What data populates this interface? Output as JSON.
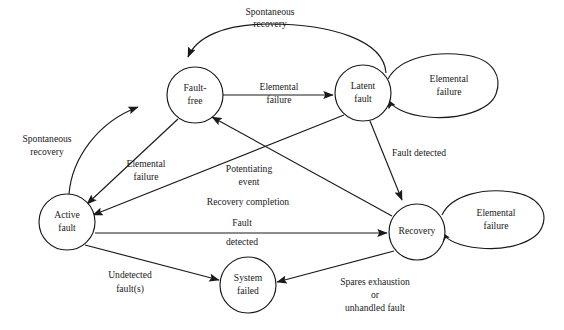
{
  "diagram": {
    "type": "state-diagram",
    "stroke_color": "#1a1a1a",
    "background_color": "#ffffff",
    "nodes": [
      {
        "id": "fault-free",
        "label_line1": "Fault-",
        "label_line2": "free",
        "cx": 195,
        "cy": 95,
        "r": 28
      },
      {
        "id": "latent-fault",
        "label_line1": "Latent",
        "label_line2": "fault",
        "cx": 363,
        "cy": 93,
        "r": 28
      },
      {
        "id": "active-fault",
        "label_line1": "Active",
        "label_line2": "fault",
        "cx": 67,
        "cy": 222,
        "r": 28
      },
      {
        "id": "recovery",
        "label_line1": "Recovery",
        "label_line2": "",
        "cx": 417,
        "cy": 232,
        "r": 28
      },
      {
        "id": "system-failed",
        "label_line1": "System",
        "label_line2": "failed",
        "cx": 248,
        "cy": 285,
        "r": 28
      }
    ],
    "self_loops": [
      {
        "id": "latent-fault-loop",
        "on": "latent-fault",
        "label_line1": "Elemental",
        "label_line2": "failure",
        "cx": 443,
        "cy": 87,
        "rx": 57,
        "ry": 27
      },
      {
        "id": "recovery-loop",
        "on": "recovery",
        "label_line1": "Elemental",
        "label_line2": "failure",
        "cx": 494,
        "cy": 220,
        "rx": 52,
        "ry": 25
      }
    ],
    "edges": [
      {
        "id": "latent-to-faultfree-spontaneous",
        "from": "latent-fault",
        "to": "fault-free",
        "label_line1": "Spontaneous",
        "label_line2": "recovery",
        "label_x": 270,
        "label_y": 13,
        "label_y2": 25
      },
      {
        "id": "faultfree-to-latent-elemental",
        "from": "fault-free",
        "to": "latent-fault",
        "label_line1": "Elemental",
        "label_line2": "failure",
        "label_x": 279,
        "label_y": 88,
        "label_y2": 101
      },
      {
        "id": "active-to-faultfree-spontaneous",
        "from": "active-fault",
        "to": "fault-free",
        "label_line1": "Spontaneous",
        "label_line2": "recovery",
        "label_x": 47,
        "label_y": 140,
        "label_y2": 153
      },
      {
        "id": "faultfree-to-active-elemental",
        "from": "fault-free",
        "to": "active-fault",
        "label_line1": "Elemental",
        "label_line2": "failure",
        "label_x": 146,
        "label_y": 165,
        "label_y2": 178
      },
      {
        "id": "latent-to-active-potentiating",
        "from": "latent-fault",
        "to": "active-fault",
        "label_line1": "Potentiating",
        "label_line2": "event",
        "label_x": 249,
        "label_y": 170,
        "label_y2": 183
      },
      {
        "id": "recovery-to-faultfree-completion",
        "from": "recovery",
        "to": "fault-free",
        "label_line1": "Recovery completion",
        "label_line2": "",
        "label_x": 248,
        "label_y": 203,
        "label_y2": 0
      },
      {
        "id": "latent-to-recovery-detected",
        "from": "latent-fault",
        "to": "recovery",
        "label_line1": "Fault detected",
        "label_line2": "",
        "label_x": 419,
        "label_y": 154,
        "label_y2": 0
      },
      {
        "id": "active-to-recovery-detected",
        "from": "active-fault",
        "to": "recovery",
        "label_line1": "Fault",
        "label_line2": "detected",
        "label_x": 242,
        "label_y": 224,
        "label_y2": 243
      },
      {
        "id": "active-to-systemfailed-undetected",
        "from": "active-fault",
        "to": "system-failed",
        "label_line1": "Undetected",
        "label_line2": "fault(s)",
        "label_x": 130,
        "label_y": 276,
        "label_y2": 290
      },
      {
        "id": "recovery-to-systemfailed-spares",
        "from": "recovery",
        "to": "system-failed",
        "label_line1": "Spares exhaustion",
        "label_line2": "or",
        "label_line3": "unhandled fault",
        "label_x": 375,
        "label_y": 283,
        "label_y2": 296,
        "label_y3": 309
      }
    ]
  }
}
